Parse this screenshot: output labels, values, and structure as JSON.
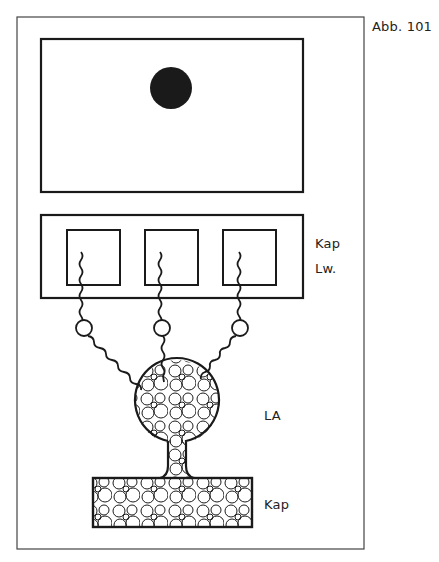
{
  "figure": {
    "label": "Abb. 101",
    "labels": {
      "cap_lw_line1": "Kap",
      "cap_lw_line2": "Lw.",
      "la": "LA",
      "kap_bottom": "Kap"
    }
  },
  "colors": {
    "ink": "#1a1a1a",
    "frame": "#444444",
    "background": "#ffffff"
  }
}
